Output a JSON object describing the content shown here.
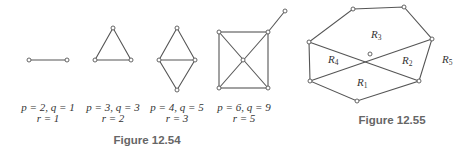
{
  "figure_12_54": {
    "caption": "Figure 12.54",
    "graphs": [
      {
        "name": "segment",
        "p_q": "p = 2, q = 1",
        "r": "r = 1"
      },
      {
        "name": "triangle",
        "p_q": "p = 3, q = 3",
        "r": "r = 2"
      },
      {
        "name": "diamond",
        "p_q": "p = 4, q = 5",
        "r": "r = 3"
      },
      {
        "name": "square-with-diagonals",
        "p_q": "p = 6, q = 9",
        "r": "r = 5"
      }
    ]
  },
  "figure_12_55": {
    "caption": "Figure 12.55",
    "regions": [
      {
        "label": "R",
        "sub": "1"
      },
      {
        "label": "R",
        "sub": "2"
      },
      {
        "label": "R",
        "sub": "3"
      },
      {
        "label": "R",
        "sub": "4"
      },
      {
        "label": "R",
        "sub": "5"
      }
    ]
  },
  "colors": {
    "edge": "#555555",
    "text": "#333333",
    "caption": "#666666"
  }
}
